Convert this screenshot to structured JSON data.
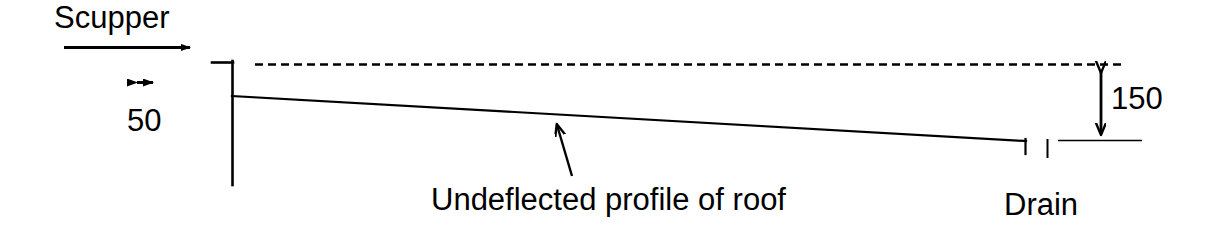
{
  "diagram": {
    "type": "engineering-section-sketch",
    "background_color": "#ffffff",
    "line_color": "#000000",
    "labels": {
      "scupper": "Scupper",
      "scupper_dimension": "50",
      "drain": "Drain",
      "drain_dimension": "150",
      "roof_profile": "Undeflected profile of roof"
    },
    "icons": {
      "flow_arrow": "right-arrow-icon",
      "scupper_height_arrow": "horizontal-double-arrow-icon",
      "drain_height_arrow": "vertical-double-arrow-icon",
      "leader_arrow": "leader-arrow-icon"
    },
    "geometry": {
      "parapet_wall": {
        "top_stub_x1": 212,
        "top_stub_x2": 232,
        "top_y": 62,
        "wall_x": 232,
        "wall_y_top": 62,
        "wall_y_bottom": 185
      },
      "roof_line": {
        "x1": 232,
        "y1": 96,
        "x2": 1026,
        "y2": 141,
        "end_drop_y": 153
      },
      "dashed_datum_line": {
        "x1": 255,
        "x2": 1126,
        "y": 64,
        "dash": 8,
        "gap": 5
      },
      "drain_tick": {
        "x": 1047,
        "y1": 139,
        "y2": 158
      },
      "drain_extension_line": {
        "x1": 1058,
        "x2": 1142,
        "y": 140
      },
      "scupper_flow_arrow": {
        "x1": 64,
        "x2": 196,
        "y": 47
      },
      "scupper_dim_arrow": {
        "cx": 145,
        "cy": 82,
        "half_width": 13
      },
      "drain_dim_arrow": {
        "x": 1101,
        "y_top": 66,
        "y_bottom": 140
      },
      "roof_leader_arrow": {
        "x1": 572,
        "y1": 176,
        "x2": 556,
        "y2": 121
      }
    },
    "dimensions": {
      "scupper_height_mm": 50,
      "drain_depth_mm": 150
    }
  }
}
